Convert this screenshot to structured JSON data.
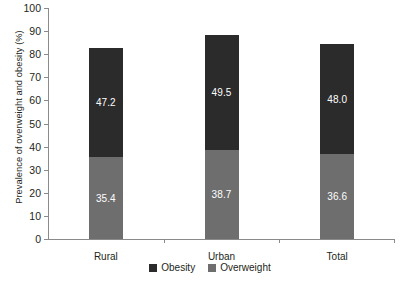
{
  "chart_data": {
    "type": "bar",
    "stacked": true,
    "title": "",
    "xlabel": "",
    "ylabel": "Prevalence of overweight and obesity (%)",
    "categories": [
      "Rural",
      "Urban",
      "Total"
    ],
    "ylim": [
      0,
      100
    ],
    "yticks": [
      0,
      10,
      20,
      30,
      40,
      50,
      60,
      70,
      80,
      90,
      100
    ],
    "ytick_labels": [
      "0",
      "10",
      "20",
      "30",
      "40",
      "50",
      "60",
      "70",
      "80",
      "90",
      "100"
    ],
    "grid": false,
    "legend_position": "bottom-center",
    "series": [
      {
        "name": "Overweight",
        "color": "#6e6e6e",
        "values": [
          35.4,
          38.7,
          36.6
        ],
        "labels": [
          "35.4",
          "38.7",
          "36.6"
        ]
      },
      {
        "name": "Obesity",
        "color": "#2b2b2b",
        "values": [
          47.2,
          49.5,
          48.0
        ],
        "labels": [
          "47.2",
          "49.5",
          "48.0"
        ]
      }
    ],
    "totals": [
      82.6,
      88.2,
      84.6
    ]
  },
  "legend": {
    "items": [
      {
        "label": "Obesity",
        "color": "#2b2b2b"
      },
      {
        "label": "Overweight",
        "color": "#6e6e6e"
      }
    ]
  }
}
